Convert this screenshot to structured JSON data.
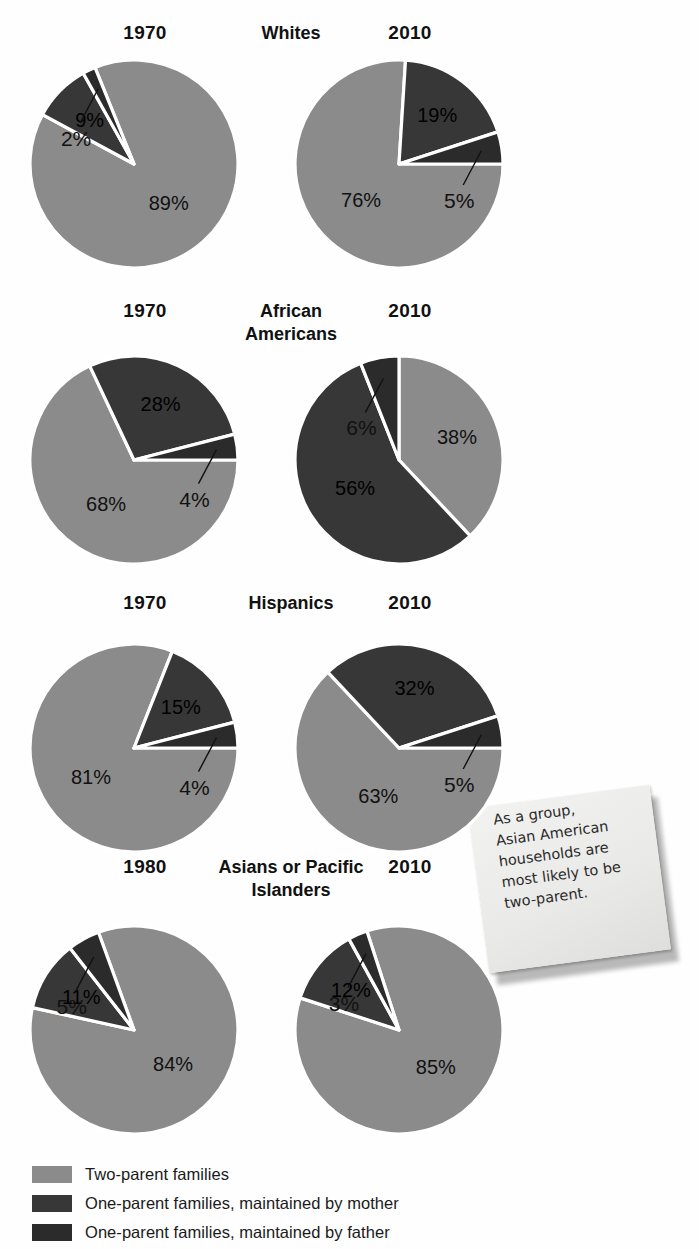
{
  "chart_data": {
    "type": "pie",
    "legend": {
      "position": "bottom",
      "entries": [
        {
          "label": "Two-parent families",
          "color": "#8b8b8b",
          "key": "two_parent"
        },
        {
          "label": "One-parent families, maintained by mother",
          "color": "#373737",
          "key": "mother"
        },
        {
          "label": "One-parent families, maintained by father",
          "color": "#2b2b2b",
          "key": "father"
        }
      ]
    },
    "groups": [
      {
        "name": "Whites",
        "title_lines": [
          "Whites"
        ],
        "charts": [
          {
            "year": "1970",
            "side": "left",
            "slices": [
              {
                "key": "two_parent",
                "value": 89,
                "label": "89%",
                "color": "#8b8b8b"
              },
              {
                "key": "mother",
                "value": 9,
                "label": "9%",
                "color": "#373737"
              },
              {
                "key": "father",
                "value": 2,
                "label": "2%",
                "color": "#2b2b2b"
              }
            ],
            "callout": "2%"
          },
          {
            "year": "2010",
            "side": "right",
            "slices": [
              {
                "key": "two_parent",
                "value": 76,
                "label": "76%",
                "color": "#8b8b8b"
              },
              {
                "key": "mother",
                "value": 19,
                "label": "19%",
                "color": "#373737"
              },
              {
                "key": "father",
                "value": 5,
                "label": "5%",
                "color": "#2b2b2b"
              }
            ],
            "callout": "5%"
          }
        ]
      },
      {
        "name": "African Americans",
        "title_lines": [
          "African",
          "Americans"
        ],
        "charts": [
          {
            "year": "1970",
            "side": "left",
            "slices": [
              {
                "key": "two_parent",
                "value": 68,
                "label": "68%",
                "color": "#8b8b8b"
              },
              {
                "key": "mother",
                "value": 28,
                "label": "28%",
                "color": "#373737"
              },
              {
                "key": "father",
                "value": 4,
                "label": "4%",
                "color": "#2b2b2b"
              }
            ],
            "callout": "4%"
          },
          {
            "year": "2010",
            "side": "right",
            "slices": [
              {
                "key": "two_parent",
                "value": 38,
                "label": "38%",
                "color": "#8b8b8b"
              },
              {
                "key": "mother",
                "value": 56,
                "label": "56%",
                "color": "#373737"
              },
              {
                "key": "father",
                "value": 6,
                "label": "6%",
                "color": "#2b2b2b"
              }
            ],
            "callout": "6%"
          }
        ]
      },
      {
        "name": "Hispanics",
        "title_lines": [
          "Hispanics"
        ],
        "charts": [
          {
            "year": "1970",
            "side": "left",
            "slices": [
              {
                "key": "two_parent",
                "value": 81,
                "label": "81%",
                "color": "#8b8b8b"
              },
              {
                "key": "mother",
                "value": 15,
                "label": "15%",
                "color": "#373737"
              },
              {
                "key": "father",
                "value": 4,
                "label": "4%",
                "color": "#2b2b2b"
              }
            ],
            "callout": "4%"
          },
          {
            "year": "2010",
            "side": "right",
            "slices": [
              {
                "key": "two_parent",
                "value": 63,
                "label": "63%",
                "color": "#8b8b8b"
              },
              {
                "key": "mother",
                "value": 32,
                "label": "32%",
                "color": "#373737"
              },
              {
                "key": "father",
                "value": 5,
                "label": "5%",
                "color": "#2b2b2b"
              }
            ],
            "callout": "5%"
          }
        ]
      },
      {
        "name": "Asians or Pacific Islanders",
        "title_lines": [
          "Asians or Pacific",
          "Islanders"
        ],
        "charts": [
          {
            "year": "1980",
            "side": "left",
            "slices": [
              {
                "key": "two_parent",
                "value": 84,
                "label": "84%",
                "color": "#8b8b8b"
              },
              {
                "key": "mother",
                "value": 11,
                "label": "11%",
                "color": "#373737"
              },
              {
                "key": "father",
                "value": 5,
                "label": "5%",
                "color": "#2b2b2b"
              }
            ],
            "callout": "5%"
          },
          {
            "year": "2010",
            "side": "right",
            "slices": [
              {
                "key": "two_parent",
                "value": 85,
                "label": "85%",
                "color": "#8b8b8b"
              },
              {
                "key": "mother",
                "value": 12,
                "label": "12%",
                "color": "#373737"
              },
              {
                "key": "father",
                "value": 3,
                "label": "3%",
                "color": "#2b2b2b"
              }
            ],
            "callout": "3%"
          }
        ]
      }
    ]
  },
  "sticky_note": {
    "lines": [
      "As a group,",
      "Asian American",
      "households are",
      "most likely to be",
      "two-parent."
    ]
  }
}
